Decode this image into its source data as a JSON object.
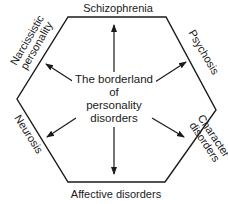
{
  "diagram": {
    "center_label": [
      "The borderland",
      "of",
      "personality",
      "disorders"
    ],
    "sides": {
      "top": "Schizophrenia",
      "upper_right": "Psychosis",
      "lower_right": [
        "Character",
        "disorders"
      ],
      "bottom": "Affective disorders",
      "lower_left": "Neurosis",
      "upper_left": [
        "Narcissistic",
        "personality"
      ]
    },
    "colors": {
      "line": "#1a1a1a",
      "background": "#ffffff"
    }
  }
}
